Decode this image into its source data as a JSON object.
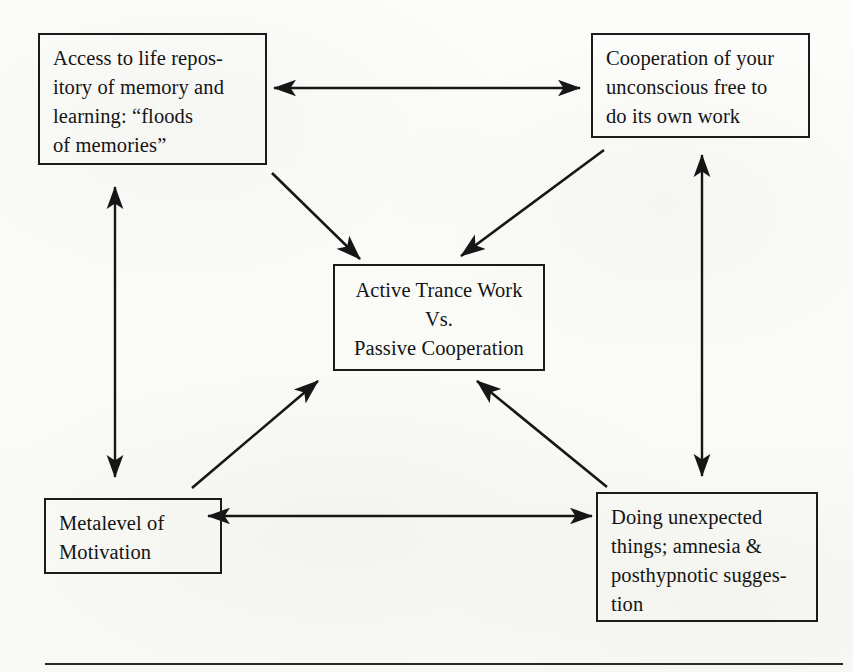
{
  "diagram": {
    "ink_color": "#1b1b1b",
    "page_color": "#fdfdfb",
    "nodes": {
      "access": {
        "id": "access-to-life-repository",
        "text": "Access to life repos-\nitory of memory and\nlearning: “floods\nof memories”",
        "align": "left"
      },
      "cooperation": {
        "id": "cooperation-of-unconscious",
        "text": "Cooperation of your\nunconscious free to\ndo its own work",
        "align": "left"
      },
      "center": {
        "id": "active-trance-work",
        "text": "Active Trance Work\nVs.\nPassive Cooperation",
        "align": "center"
      },
      "metalevel": {
        "id": "metalevel-of-motivation",
        "text": "Metalevel of\nMotivation",
        "align": "left"
      },
      "doing": {
        "id": "doing-unexpected-things",
        "text": "Doing unexpected\nthings; amnesia &\nposthypnotic sugges-\ntion",
        "align": "left"
      }
    },
    "connectors": [
      {
        "name": "access-to-cooperation",
        "from": "access",
        "to": "cooperation",
        "style": "double-headed",
        "orientation": "horizontal"
      },
      {
        "name": "access-to-metalevel",
        "from": "access",
        "to": "metalevel",
        "style": "double-headed",
        "orientation": "vertical"
      },
      {
        "name": "cooperation-to-doing",
        "from": "cooperation",
        "to": "doing",
        "style": "double-headed",
        "orientation": "vertical"
      },
      {
        "name": "metalevel-to-doing",
        "from": "metalevel",
        "to": "doing",
        "style": "double-headed",
        "orientation": "horizontal"
      },
      {
        "name": "access-to-center",
        "from": "access",
        "to": "center",
        "style": "single-headed",
        "orientation": "diagonal"
      },
      {
        "name": "cooperation-to-center",
        "from": "cooperation",
        "to": "center",
        "style": "single-headed",
        "orientation": "diagonal"
      },
      {
        "name": "metalevel-to-center",
        "from": "metalevel",
        "to": "center",
        "style": "single-headed",
        "orientation": "diagonal"
      },
      {
        "name": "doing-to-center",
        "from": "doing",
        "to": "center",
        "style": "single-headed",
        "orientation": "diagonal"
      }
    ]
  }
}
